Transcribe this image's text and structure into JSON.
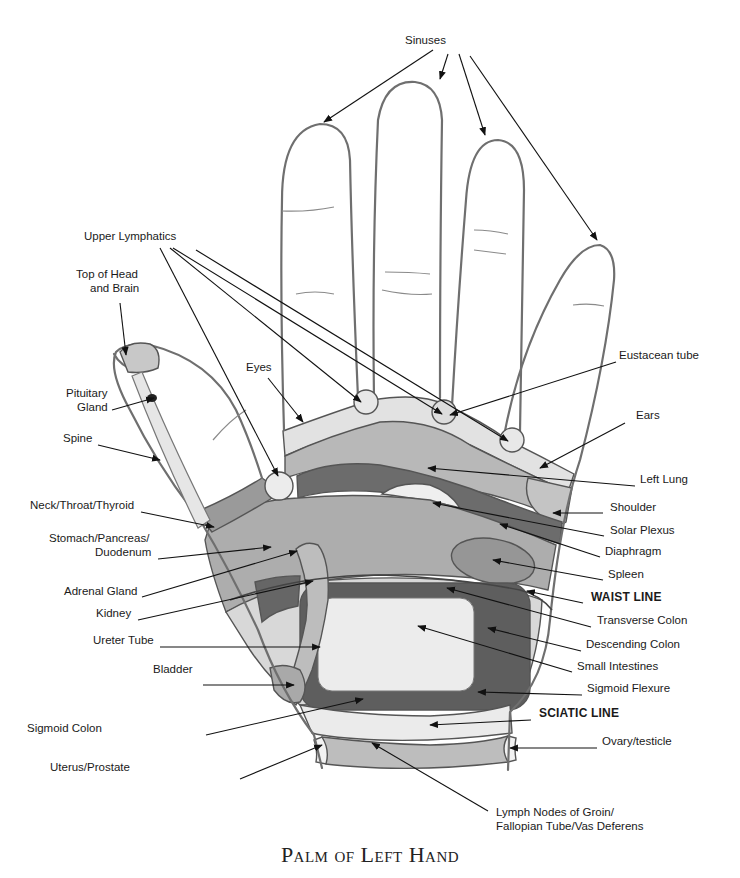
{
  "diagram": {
    "title": "Palm of Left Hand",
    "colors": {
      "outline": "#6f6f6f",
      "light_zone": "#e6e6e6",
      "mid_zone": "#b4b4b4",
      "dark_zone": "#6a6a6a",
      "spleen_zone": "#9c9c9c",
      "intestine_zone": "#ececec"
    },
    "labels": [
      {
        "id": "sinuses",
        "text": "Sinuses",
        "x": 405,
        "y": 40,
        "align": "left"
      },
      {
        "id": "upper-lymphatics",
        "text": "Upper Lymphatics",
        "x": 84,
        "y": 236,
        "align": "left"
      },
      {
        "id": "top-of-head",
        "text": "Top of Head",
        "x": 76,
        "y": 274,
        "align": "left"
      },
      {
        "id": "and-brain",
        "text": "and Brain",
        "x": 90,
        "y": 288,
        "align": "left"
      },
      {
        "id": "eyes",
        "text": "Eyes",
        "x": 246,
        "y": 367,
        "align": "left"
      },
      {
        "id": "eustacean-tube",
        "text": "Eustacean tube",
        "x": 619,
        "y": 355,
        "align": "left"
      },
      {
        "id": "pituitary",
        "text": "Pituitary",
        "x": 66,
        "y": 393,
        "align": "left"
      },
      {
        "id": "gland",
        "text": "Gland",
        "x": 77,
        "y": 407,
        "align": "left"
      },
      {
        "id": "ears",
        "text": "Ears",
        "x": 636,
        "y": 415,
        "align": "left"
      },
      {
        "id": "spine",
        "text": "Spine",
        "x": 63,
        "y": 438,
        "align": "left"
      },
      {
        "id": "left-lung",
        "text": "Left Lung",
        "x": 640,
        "y": 479,
        "align": "left"
      },
      {
        "id": "shoulder",
        "text": "Shoulder",
        "x": 610,
        "y": 507,
        "align": "left"
      },
      {
        "id": "neck-throat",
        "text": "Neck/Throat/Thyroid",
        "x": 30,
        "y": 505,
        "align": "left"
      },
      {
        "id": "solar-plexus",
        "text": "Solar Plexus",
        "x": 610,
        "y": 530,
        "align": "left"
      },
      {
        "id": "stomach",
        "text": "Stomach/Pancreas/",
        "x": 49,
        "y": 538,
        "align": "left"
      },
      {
        "id": "duodenum",
        "text": "Duodenum",
        "x": 95,
        "y": 552,
        "align": "left"
      },
      {
        "id": "diaphragm",
        "text": "Diaphragm",
        "x": 605,
        "y": 551,
        "align": "left"
      },
      {
        "id": "spleen",
        "text": "Spleen",
        "x": 608,
        "y": 574,
        "align": "left"
      },
      {
        "id": "adrenal",
        "text": "Adrenal Gland",
        "x": 64,
        "y": 591,
        "align": "left"
      },
      {
        "id": "waist-line",
        "text": "WAIST LINE",
        "x": 591,
        "y": 597,
        "align": "left",
        "bold": true
      },
      {
        "id": "kidney",
        "text": "Kidney",
        "x": 96,
        "y": 613,
        "align": "left"
      },
      {
        "id": "transverse-colon",
        "text": "Transverse Colon",
        "x": 597,
        "y": 620,
        "align": "left"
      },
      {
        "id": "ureter-tube",
        "text": "Ureter Tube",
        "x": 93,
        "y": 640,
        "align": "left"
      },
      {
        "id": "descending-colon",
        "text": "Descending Colon",
        "x": 586,
        "y": 644,
        "align": "left"
      },
      {
        "id": "small-intestines",
        "text": "Small Intestines",
        "x": 577,
        "y": 666,
        "align": "left"
      },
      {
        "id": "bladder",
        "text": "Bladder",
        "x": 153,
        "y": 669,
        "align": "left"
      },
      {
        "id": "sigmoid-flexure",
        "text": "Sigmoid Flexure",
        "x": 587,
        "y": 688,
        "align": "left"
      },
      {
        "id": "sciatic-line",
        "text": "SCIATIC LINE",
        "x": 539,
        "y": 713,
        "align": "left",
        "bold": true
      },
      {
        "id": "sigmoid-colon",
        "text": "Sigmoid Colon",
        "x": 27,
        "y": 728,
        "align": "left"
      },
      {
        "id": "ovary-testicle",
        "text": "Ovary/testicle",
        "x": 602,
        "y": 741,
        "align": "left"
      },
      {
        "id": "uterus-prostate",
        "text": "Uterus/Prostate",
        "x": 50,
        "y": 767,
        "align": "left"
      },
      {
        "id": "lymph-nodes-1",
        "text": "Lymph Nodes of Groin/",
        "x": 496,
        "y": 812,
        "align": "left"
      },
      {
        "id": "lymph-nodes-2",
        "text": "Fallopian Tube/Vas Deferens",
        "x": 496,
        "y": 826,
        "align": "left"
      }
    ],
    "leaders": [
      {
        "for": "sinuses",
        "x1": 433,
        "y1": 50,
        "x2": 324,
        "y2": 122,
        "arrow": true
      },
      {
        "for": "sinuses",
        "x1": 448,
        "y1": 54,
        "x2": 440,
        "y2": 79,
        "arrow": true
      },
      {
        "for": "sinuses",
        "x1": 459,
        "y1": 54,
        "x2": 485,
        "y2": 135,
        "arrow": true
      },
      {
        "for": "sinuses",
        "x1": 470,
        "y1": 56,
        "x2": 597,
        "y2": 240,
        "arrow": true
      },
      {
        "for": "upper-lymphatics",
        "x1": 160,
        "y1": 248,
        "x2": 278,
        "y2": 476,
        "arrow": true
      },
      {
        "for": "upper-lymphatics",
        "x1": 170,
        "y1": 248,
        "x2": 361,
        "y2": 402,
        "arrow": true
      },
      {
        "for": "upper-lymphatics",
        "x1": 173,
        "y1": 248,
        "x2": 442,
        "y2": 414,
        "arrow": true
      },
      {
        "for": "upper-lymphatics",
        "x1": 196,
        "y1": 250,
        "x2": 508,
        "y2": 441,
        "arrow": true
      },
      {
        "for": "top-of-head",
        "x1": 120,
        "y1": 303,
        "x2": 126,
        "y2": 355,
        "arrow": true
      },
      {
        "for": "pituitary",
        "x1": 112,
        "y1": 410,
        "x2": 154,
        "y2": 398,
        "arrow": true
      },
      {
        "for": "spine",
        "x1": 98,
        "y1": 445,
        "x2": 160,
        "y2": 460,
        "arrow": true
      },
      {
        "for": "eyes",
        "x1": 268,
        "y1": 378,
        "x2": 303,
        "y2": 422,
        "arrow": true
      },
      {
        "for": "eustacean-tube",
        "x1": 616,
        "y1": 362,
        "x2": 450,
        "y2": 415,
        "arrow": true
      },
      {
        "for": "ears",
        "x1": 625,
        "y1": 423,
        "x2": 540,
        "y2": 468,
        "arrow": true
      },
      {
        "for": "left-lung",
        "x1": 635,
        "y1": 486,
        "x2": 428,
        "y2": 468,
        "arrow": true
      },
      {
        "for": "shoulder",
        "x1": 603,
        "y1": 513,
        "x2": 553,
        "y2": 513,
        "arrow": true
      },
      {
        "for": "solar-plexus",
        "x1": 604,
        "y1": 536,
        "x2": 433,
        "y2": 503,
        "arrow": true
      },
      {
        "for": "diaphragm",
        "x1": 600,
        "y1": 557,
        "x2": 500,
        "y2": 524,
        "arrow": true
      },
      {
        "for": "spleen",
        "x1": 603,
        "y1": 580,
        "x2": 493,
        "y2": 560,
        "arrow": true
      },
      {
        "for": "waist-line",
        "x1": 583,
        "y1": 603,
        "x2": 527,
        "y2": 591,
        "arrow": true
      },
      {
        "for": "transverse-colon",
        "x1": 591,
        "y1": 627,
        "x2": 447,
        "y2": 588,
        "arrow": true
      },
      {
        "for": "descending-colon",
        "x1": 581,
        "y1": 651,
        "x2": 488,
        "y2": 628,
        "arrow": true
      },
      {
        "for": "small-intestines",
        "x1": 572,
        "y1": 672,
        "x2": 418,
        "y2": 626,
        "arrow": true
      },
      {
        "for": "sigmoid-flexure",
        "x1": 582,
        "y1": 695,
        "x2": 478,
        "y2": 692,
        "arrow": true
      },
      {
        "for": "sciatic-line",
        "x1": 531,
        "y1": 720,
        "x2": 430,
        "y2": 725,
        "arrow": true
      },
      {
        "for": "ovary-testicle",
        "x1": 597,
        "y1": 748,
        "x2": 510,
        "y2": 748,
        "arrow": true
      },
      {
        "for": "neck-throat",
        "x1": 141,
        "y1": 512,
        "x2": 214,
        "y2": 527,
        "arrow": true
      },
      {
        "for": "stomach",
        "x1": 158,
        "y1": 559,
        "x2": 271,
        "y2": 547,
        "arrow": true
      },
      {
        "for": "adrenal",
        "x1": 142,
        "y1": 597,
        "x2": 297,
        "y2": 551,
        "arrow": true
      },
      {
        "for": "kidney",
        "x1": 138,
        "y1": 620,
        "x2": 313,
        "y2": 581,
        "arrow": true
      },
      {
        "for": "ureter-tube",
        "x1": 160,
        "y1": 647,
        "x2": 320,
        "y2": 647,
        "arrow": true
      },
      {
        "for": "bladder",
        "x1": 203,
        "y1": 685,
        "x2": 294,
        "y2": 685,
        "arrow": true
      },
      {
        "for": "sigmoid-colon",
        "x1": 206,
        "y1": 735,
        "x2": 363,
        "y2": 699,
        "arrow": true
      },
      {
        "for": "uterus-prostate",
        "x1": 240,
        "y1": 779,
        "x2": 322,
        "y2": 745,
        "arrow": true
      },
      {
        "for": "lymph-nodes",
        "x1": 488,
        "y1": 811,
        "x2": 372,
        "y2": 743,
        "arrow": true
      }
    ]
  }
}
